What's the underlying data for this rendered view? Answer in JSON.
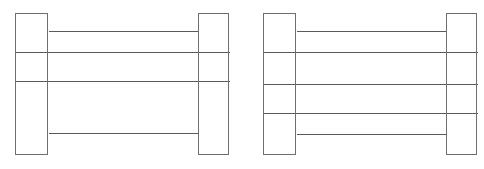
{
  "document": {
    "type": "engineering-line-drawing",
    "description": "Two side-elevation cross-section drawings of built-up beam sections, each formed by two vertical end plates (flanges) joined by horizontal web plate lines",
    "canvas": {
      "width": 484,
      "height": 169,
      "background_color": "#ffffff"
    },
    "style": {
      "line_color": "#6e6e6e",
      "web_line_color": "#5a5a5a",
      "fill_color": "#ffffff",
      "line_width": 1
    }
  },
  "figures": [
    {
      "id": "figure-left",
      "name": "left-beam-section",
      "web_line_count": 4,
      "flange_count": 2,
      "bounds": {
        "x": 15,
        "y": 13,
        "width": 214,
        "height": 142
      },
      "flanges": [
        {
          "id": "left-flange",
          "name": "left-end-plate",
          "x": 15,
          "y": 13,
          "width": 33,
          "height": 142
        },
        {
          "id": "right-flange",
          "name": "right-end-plate",
          "x": 198,
          "y": 13,
          "width": 31,
          "height": 142
        }
      ],
      "web_lines": [
        {
          "id": "web-line-1",
          "y": 31,
          "x1": 48,
          "x2": 198,
          "span": "inset"
        },
        {
          "id": "web-line-2",
          "y": 52,
          "x1": 15,
          "x2": 229,
          "span": "full"
        },
        {
          "id": "web-line-3",
          "y": 81,
          "x1": 15,
          "x2": 229,
          "span": "full"
        },
        {
          "id": "web-line-4",
          "y": 133,
          "x1": 48,
          "x2": 198,
          "span": "inset"
        }
      ]
    },
    {
      "id": "figure-right",
      "name": "right-beam-section",
      "web_line_count": 5,
      "flange_count": 2,
      "bounds": {
        "x": 263,
        "y": 13,
        "width": 214,
        "height": 142
      },
      "flanges": [
        {
          "id": "left-flange",
          "name": "left-end-plate",
          "x": 263,
          "y": 13,
          "width": 33,
          "height": 142
        },
        {
          "id": "right-flange",
          "name": "right-end-plate",
          "x": 446,
          "y": 13,
          "width": 31,
          "height": 142
        }
      ],
      "web_lines": [
        {
          "id": "web-line-1",
          "y": 31,
          "x1": 296,
          "x2": 446,
          "span": "inset"
        },
        {
          "id": "web-line-2",
          "y": 52,
          "x1": 263,
          "x2": 477,
          "span": "full"
        },
        {
          "id": "web-line-3",
          "y": 84,
          "x1": 263,
          "x2": 477,
          "span": "full"
        },
        {
          "id": "web-line-4",
          "y": 113,
          "x1": 263,
          "x2": 477,
          "span": "full"
        },
        {
          "id": "web-line-5",
          "y": 134,
          "x1": 296,
          "x2": 446,
          "span": "inset"
        }
      ]
    }
  ],
  "labels": {
    "captions": []
  }
}
